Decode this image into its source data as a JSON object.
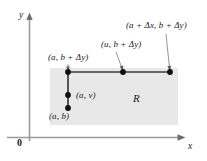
{
  "figure": {
    "type": "math-diagram",
    "background_color": "#ffffff",
    "region_fill_color": "#e8e8e8",
    "line_color": "#3a3a3a",
    "axis_color": "#8a8a8a",
    "dot_color": "#101010",
    "axes": {
      "y_axis_label": "y",
      "x_axis_label": "x",
      "origin_label": "0"
    },
    "region": {
      "label": "R"
    },
    "points": [
      {
        "name": "corner-a-b",
        "label": "(a, b)",
        "x": 68,
        "y": 108
      },
      {
        "name": "interior-a-v",
        "label": "(a, v)",
        "x": 68,
        "y": 95
      },
      {
        "name": "corner-a-b-plus-dy",
        "label": "(a, b + Δy)",
        "x": 68,
        "y": 72
      },
      {
        "name": "interior-u-b-plus-dy",
        "label": "(u, b + Δy)",
        "x": 123,
        "y": 72
      },
      {
        "name": "corner-a-plus-dx-b-plus-dy",
        "label": "(a + Δx, b + Δy)",
        "x": 170,
        "y": 72
      }
    ],
    "labels": {
      "a_b": "(a, b)",
      "a_v": "(a, v)",
      "a_b_dy": "(a, b + Δy)",
      "u_b_dy": "(u, b + Δy)",
      "a_dx_b_dy": "(a + Δx, b + Δy)"
    }
  }
}
